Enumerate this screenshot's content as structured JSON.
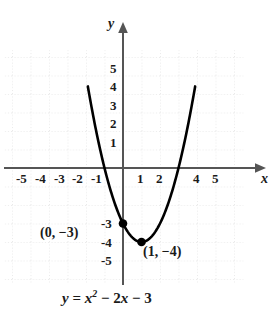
{
  "chart_data": {
    "type": "line",
    "title": "",
    "caption": "y = x² − 2x − 3",
    "equation": {
      "lhs": "y",
      "eq": "=",
      "var": "x",
      "exponent": "2",
      "term2": "− 2",
      "var2": "x",
      "term3": "− 3"
    },
    "function": "y = x^2 - 2x - 3",
    "xlabel": "x",
    "ylabel": "y",
    "xlim": [
      -6.4,
      6.5
    ],
    "ylim": [
      -6.2,
      6.4
    ],
    "grid": true,
    "grid_spacing": 1,
    "x_ticks": [
      "-5",
      "-4",
      "-3",
      "-2",
      "-1",
      "1",
      "2",
      "4",
      "5"
    ],
    "x_tick_values": [
      -5,
      -4,
      -3,
      -2,
      -1,
      1,
      2,
      4,
      5
    ],
    "y_ticks": [
      "5",
      "4",
      "3",
      "2",
      "1",
      "-3",
      "-4",
      "-5"
    ],
    "y_tick_values": [
      5,
      4,
      3,
      2,
      1,
      -3,
      -4,
      -5
    ],
    "curve_points": [
      {
        "x": -1.9,
        "y": 4.4
      },
      {
        "x": -1.5,
        "y": 2.25
      },
      {
        "x": -1,
        "y": 0
      },
      {
        "x": -0.5,
        "y": -1.75
      },
      {
        "x": 0,
        "y": -3
      },
      {
        "x": 0.5,
        "y": -3.75
      },
      {
        "x": 1,
        "y": -4
      },
      {
        "x": 1.5,
        "y": -3.75
      },
      {
        "x": 2,
        "y": -3
      },
      {
        "x": 2.5,
        "y": -1.75
      },
      {
        "x": 3,
        "y": 0
      },
      {
        "x": 3.5,
        "y": 2.25
      },
      {
        "x": 3.9,
        "y": 4.4
      }
    ],
    "marked_points": [
      {
        "x": 0,
        "y": -3,
        "label": "(0, −3)",
        "role": "y-intercept"
      },
      {
        "x": 1,
        "y": -4,
        "label": "(1, −4)",
        "role": "vertex"
      }
    ],
    "colors": {
      "curve": "#000000",
      "axis": "#444444",
      "grid": "#d8d8d8",
      "text": "#1a1a1a",
      "background": "#ffffff"
    }
  }
}
